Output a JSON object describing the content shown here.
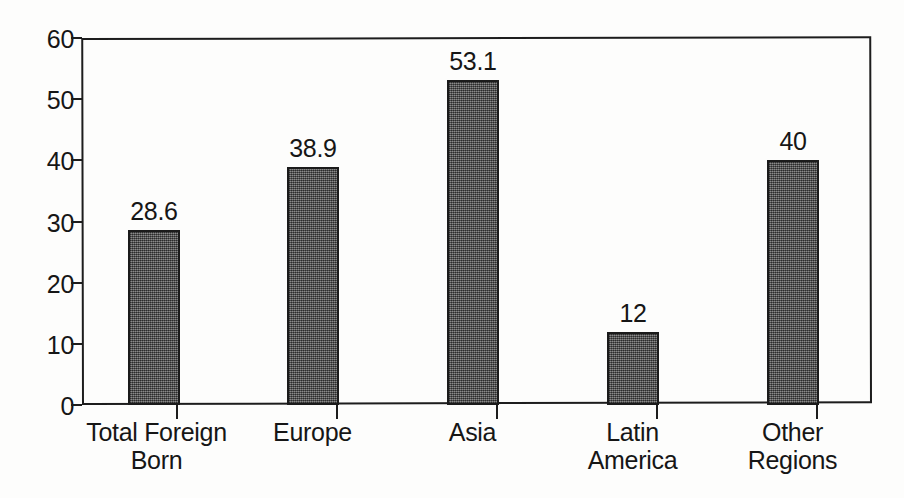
{
  "chart_data": {
    "type": "bar",
    "title": "",
    "subtitle": "",
    "xlabel": "",
    "ylabel": "",
    "ylim": [
      0,
      60
    ],
    "ytick_values": [
      60,
      50,
      40,
      30,
      20,
      10,
      0
    ],
    "ytick_labels": [
      "60",
      "50",
      "40",
      "30",
      "20",
      "10",
      "0"
    ],
    "grid": false,
    "legend": false,
    "legend_position": "none",
    "categories": [
      "Total Foreign Born",
      "Europe",
      "Asia",
      "Latin America",
      "Other Regions"
    ],
    "category_lines": [
      [
        "Total Foreign",
        "Born"
      ],
      [
        "Europe"
      ],
      [
        "Asia"
      ],
      [
        "Latin",
        "America"
      ],
      [
        "Other",
        "Regions"
      ]
    ],
    "values": [
      28.6,
      38.9,
      53.1,
      12,
      40
    ],
    "value_labels": [
      "28.6",
      "38.9",
      "53.1",
      "12",
      "40"
    ],
    "bar_color": "#5d5d5d",
    "bar_edge_color": "#1b1b1b",
    "axis_color": "#1d1d1d",
    "text_color": "#161616",
    "background_color": "#fdfdfc"
  }
}
